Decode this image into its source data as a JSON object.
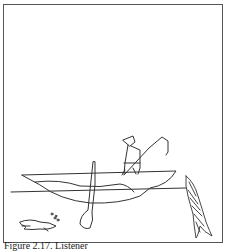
{
  "figure": {
    "caption": "Figure 2.17. Listener",
    "colors": {
      "line": "#333333",
      "frame": "#555555",
      "background": "#ffffff"
    }
  }
}
